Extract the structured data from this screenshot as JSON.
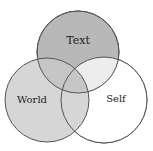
{
  "diagram": {
    "type": "venn",
    "circles": [
      {
        "label": "Text",
        "cx": 78,
        "cy": 52,
        "r": 41,
        "fill": "#b8b8b8"
      },
      {
        "label": "World",
        "cx": 47,
        "cy": 100,
        "r": 42,
        "fill": "#d6d6d6"
      },
      {
        "label": "Self",
        "cx": 104,
        "cy": 100,
        "r": 43,
        "fill": "#ffffff"
      }
    ],
    "overlap_fill": "#c4c4c4",
    "stroke": "#555555"
  }
}
